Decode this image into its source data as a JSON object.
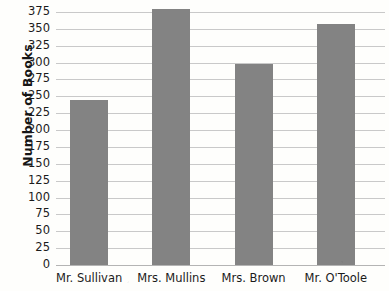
{
  "chart_data": {
    "type": "bar",
    "title": "",
    "xlabel": "",
    "ylabel": "Number of Books",
    "categories": [
      "Mr. Sullivan",
      "Mrs. Mullins",
      "Mrs. Brown",
      "Mr. O'Toole"
    ],
    "values": [
      245,
      380,
      298,
      357
    ],
    "ylim": [
      0,
      375
    ],
    "ytick_step": 25,
    "ytick_labels": [
      "375",
      "350",
      "325",
      "300",
      "275",
      "250",
      "225",
      "200",
      "175",
      "150",
      "125",
      "100",
      "75",
      "50",
      "25",
      "0"
    ],
    "ytick_values": [
      375,
      350,
      325,
      300,
      275,
      250,
      225,
      200,
      175,
      150,
      125,
      100,
      75,
      50,
      25,
      0
    ],
    "grid": true,
    "legend": false,
    "bar_color": "#838383",
    "grid_color": "#c9c9c9",
    "axis_color": "#b4b4b4",
    "background_color": "#fefefc"
  },
  "axis": {
    "y_title": "Number of Books"
  }
}
